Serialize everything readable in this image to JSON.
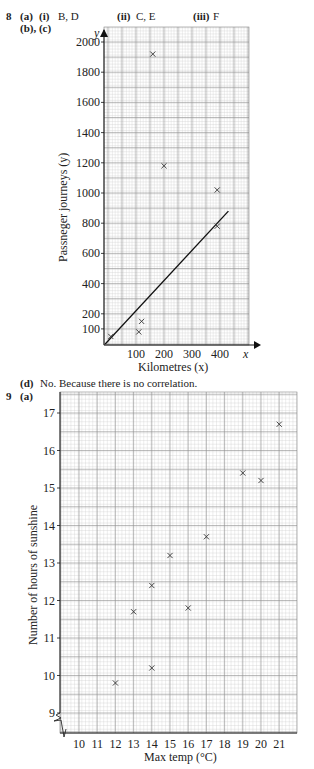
{
  "header": {
    "q8_number": "8",
    "q8_part_a": "(a)",
    "q8_part_a_i": "(i)",
    "q8_answer_i": "B, D",
    "q8_part_a_ii": "(ii)",
    "q8_answer_ii": "C, E",
    "q8_part_a_iii": "(iii)",
    "q8_answer_iii": "F",
    "q8_part_bc": "(b), (c)"
  },
  "q8d": {
    "label": "(d)",
    "text": "No. Because there is no correlation."
  },
  "q9": {
    "number": "9",
    "part": "(a)"
  },
  "chart_data": [
    {
      "type": "scatter",
      "title": "",
      "xlabel": "Kilometres (x)",
      "ylabel": "Passneger journeys (y)",
      "x_axis_letter": "x",
      "y_axis_letter": "y",
      "xlim": [
        0,
        480
      ],
      "ylim": [
        0,
        2050
      ],
      "xticks": [
        100,
        200,
        300,
        400
      ],
      "yticks": [
        100,
        200,
        400,
        600,
        800,
        1000,
        1200,
        1400,
        1600,
        1800,
        2000
      ],
      "grid": true,
      "points": [
        {
          "x": 10,
          "y": 50
        },
        {
          "x": 110,
          "y": 80
        },
        {
          "x": 120,
          "y": 150
        },
        {
          "x": 160,
          "y": 1920
        },
        {
          "x": 200,
          "y": 1180
        },
        {
          "x": 390,
          "y": 1020
        },
        {
          "x": 390,
          "y": 780
        }
      ],
      "line_of_best_fit": {
        "x1": -10,
        "y1": 0,
        "x2": 430,
        "y2": 880
      }
    },
    {
      "type": "scatter",
      "title": "",
      "xlabel": "Max temp (°C)",
      "ylabel": "Number of hours of sunshine",
      "xlim": [
        9,
        22
      ],
      "ylim": [
        8.5,
        17.5
      ],
      "xticks": [
        10,
        11,
        12,
        13,
        14,
        15,
        16,
        17,
        18,
        19,
        20,
        21
      ],
      "yticks": [
        9,
        10,
        11,
        12,
        13,
        14,
        15,
        16,
        17
      ],
      "grid": true,
      "axis_break": true,
      "points": [
        {
          "x": 12,
          "y": 9.8
        },
        {
          "x": 13,
          "y": 11.7
        },
        {
          "x": 14,
          "y": 10.2
        },
        {
          "x": 14,
          "y": 12.4
        },
        {
          "x": 15,
          "y": 13.2
        },
        {
          "x": 16,
          "y": 11.8
        },
        {
          "x": 17,
          "y": 13.7
        },
        {
          "x": 19,
          "y": 15.4
        },
        {
          "x": 20,
          "y": 15.2
        },
        {
          "x": 21,
          "y": 16.7
        }
      ]
    }
  ]
}
